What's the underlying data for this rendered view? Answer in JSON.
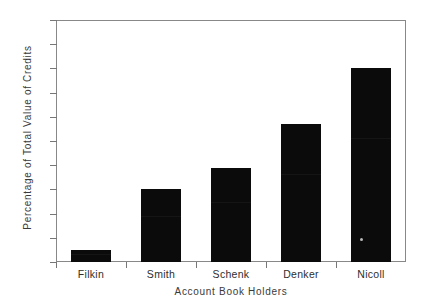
{
  "chart_data": {
    "type": "bar",
    "title": "",
    "subtitle": "",
    "xlabel": "Account Book Holders",
    "ylabel": "Percentage of Total Value of Credits",
    "categories": [
      "Filkin",
      "Smith",
      "Schenk",
      "Denker",
      "Nicoll"
    ],
    "values": [
      5,
      30,
      39,
      57,
      80
    ],
    "series": [
      {
        "name": "Percentage of Total Value of Credits",
        "values": [
          5,
          30,
          39,
          57,
          80
        ]
      }
    ],
    "ylim": [
      0,
      100
    ],
    "y_ticks": [
      0,
      10,
      20,
      30,
      40,
      50,
      60,
      70,
      80,
      90,
      100
    ],
    "y_tick_labels": [
      "0",
      "10",
      "20",
      "30",
      "40",
      "50",
      "60",
      "70",
      "80",
      "90",
      "100"
    ],
    "grid": false,
    "legend": false,
    "legend_position": "none",
    "bar_color": "#0b0b0b",
    "frame_color": "#888888",
    "text_color": "#2e2e2e",
    "background_color": "#ffffff"
  },
  "annotations": {
    "speck_label": "scan-artifact-speck"
  }
}
